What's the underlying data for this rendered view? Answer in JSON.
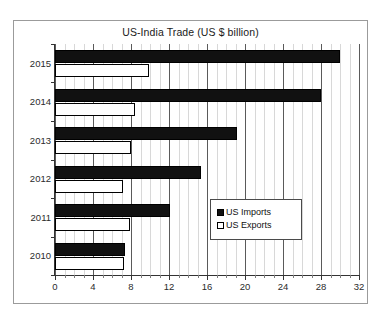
{
  "top_clipped_text": "",
  "chart_data": {
    "type": "bar",
    "orientation": "horizontal",
    "title": "US-India Trade (US $ billion)",
    "xlabel": "",
    "ylabel": "",
    "categories": [
      "2015",
      "2014",
      "2013",
      "2012",
      "2011",
      "2010"
    ],
    "series": [
      {
        "name": "US Imports",
        "color": "#111111",
        "marker": "filled-square",
        "values": [
          30.0,
          28.0,
          19.2,
          15.4,
          12.1,
          7.4
        ]
      },
      {
        "name": "US Exports",
        "color": "#ffffff",
        "marker": "hollow-square",
        "values": [
          9.9,
          8.4,
          8.0,
          7.2,
          7.9,
          7.3
        ]
      }
    ],
    "xlim": [
      0,
      32
    ],
    "x_major_ticks": [
      0,
      4,
      8,
      12,
      16,
      20,
      24,
      28,
      32
    ],
    "x_minor_tick_step": 1,
    "x_tick_labels": [
      "0",
      "4",
      "8",
      "12",
      "16",
      "20",
      "24",
      "28",
      "32"
    ],
    "grid": true,
    "grid_axis": "x",
    "legend_position": "inside-bottom-right"
  },
  "legend": {
    "items": [
      {
        "label": "US Imports"
      },
      {
        "label": "US Exports"
      }
    ]
  },
  "colors": {
    "imports": "#111111",
    "exports": "#ffffff",
    "frame": "#9b9b9b",
    "gridline_major": "#5a5a5a",
    "gridline_minor": "#d8d8d8",
    "axis": "#333333"
  }
}
